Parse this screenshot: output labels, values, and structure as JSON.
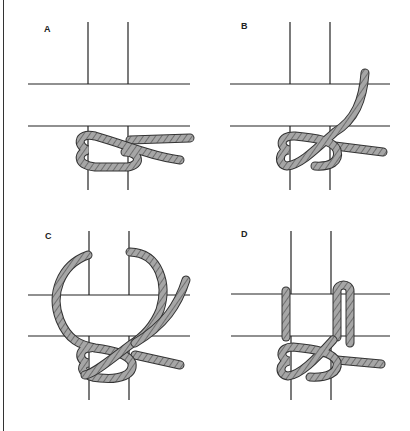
{
  "figure": {
    "title": "",
    "panels": [
      {
        "id": "A",
        "label": "A"
      },
      {
        "id": "B",
        "label": "B"
      },
      {
        "id": "C",
        "label": "C"
      },
      {
        "id": "D",
        "label": "D"
      }
    ],
    "colors": {
      "line": "#222222",
      "rope_fill": "#a6a6a6",
      "rope_outline": "#333333",
      "rope_stripe": "#555555"
    }
  }
}
